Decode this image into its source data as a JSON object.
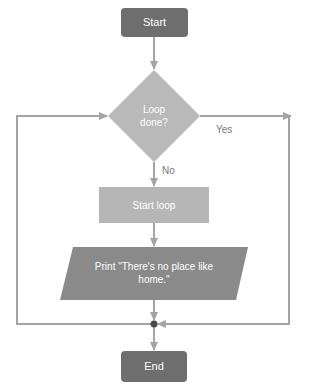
{
  "diagram": {
    "type": "flowchart",
    "colors": {
      "terminal_fill": "#6e6e6e",
      "decision_fill": "#b9b9b9",
      "process_fill": "#b6b6b6",
      "io_fill": "#8a8a8a",
      "connector": "#a4a4a4",
      "junction": "#4a4a4a",
      "node_text": "#ffffff",
      "label_text": "#777777"
    },
    "nodes": {
      "start": {
        "label": "Start",
        "shape": "rounded-rect"
      },
      "decision": {
        "label_line1": "Loop",
        "label_line2": "done?",
        "shape": "diamond"
      },
      "process": {
        "label": "Start loop",
        "shape": "rect"
      },
      "io": {
        "label_line1": "Print \"There's no place like",
        "label_line2": "home.\"",
        "shape": "parallelogram"
      },
      "end": {
        "label": "End",
        "shape": "rounded-rect"
      }
    },
    "edges": {
      "yes_label": "Yes",
      "no_label": "No"
    }
  }
}
